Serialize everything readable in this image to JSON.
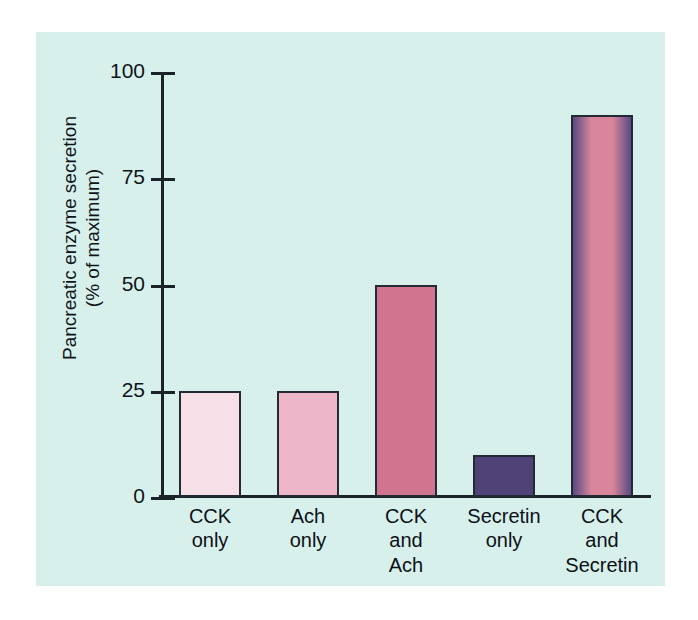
{
  "chart_data": {
    "type": "bar",
    "title": "",
    "xlabel": "",
    "ylabel_line1": "Pancreatic enzyme secretion",
    "ylabel_line2": "(% of maximum)",
    "ylim": [
      0,
      100
    ],
    "yticks": [
      "0",
      "25",
      "50",
      "75",
      "100"
    ],
    "ytick_values": [
      0,
      25,
      50,
      75,
      100
    ],
    "grid": false,
    "legend": "none",
    "categories": [
      "CCK only",
      "Ach only",
      "CCK and Ach",
      "Secretin only",
      "CCK and Secretin"
    ],
    "values": [
      25,
      25,
      50,
      10,
      90
    ],
    "bars": [
      {
        "label_lines": [
          "CCK",
          "only"
        ],
        "value": 25,
        "fill": "#f7dfe7",
        "fill2": "#f7dfe7",
        "gradient": false,
        "outline": "#232a33"
      },
      {
        "label_lines": [
          "Ach",
          "only"
        ],
        "value": 25,
        "fill": "#edb6c9",
        "fill2": "#edb6c9",
        "gradient": false,
        "outline": "#232a33"
      },
      {
        "label_lines": [
          "CCK",
          "and",
          "Ach"
        ],
        "value": 50,
        "fill": "#d0748f",
        "fill2": "#d0748f",
        "gradient": false,
        "outline": "#232a33"
      },
      {
        "label_lines": [
          "Secretin",
          "only"
        ],
        "value": 10,
        "fill": "#4e4277",
        "fill2": "#4e4277",
        "gradient": false,
        "outline": "#232a33"
      },
      {
        "label_lines": [
          "CCK",
          "and",
          "Secretin"
        ],
        "value": 90,
        "fill": "#5a4a83",
        "fill2": "#d9869c",
        "gradient": true,
        "outline": "#232a33"
      }
    ]
  },
  "colors": {
    "panel_background": "#d7f0ec",
    "page_background": "#ffffff",
    "axis": "#1b2228",
    "text": "#101418"
  }
}
